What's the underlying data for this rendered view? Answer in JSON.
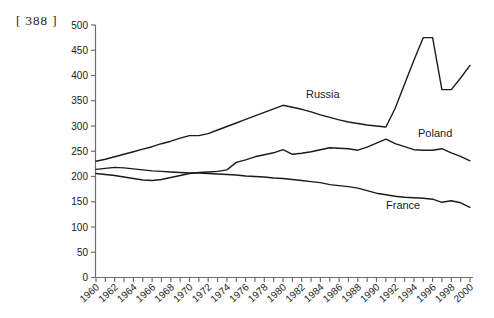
{
  "page_marker": "[ 388 ]",
  "colors": {
    "background": "#ffffff",
    "line": "#1b1b1b",
    "axis": "#6e6e6e",
    "tick_text": "#1a1a1a",
    "series_label_text": "#1b1b1b"
  },
  "chart_data": {
    "type": "line",
    "title": "",
    "subtitle": "",
    "xlabel": "",
    "ylabel": "",
    "grid": false,
    "legend_position": "inline-labels",
    "ylim": [
      0,
      500
    ],
    "y_tick_step": 50,
    "x_start": 1960,
    "x_end": 2000,
    "x_tick_step": 1,
    "x_label_step": 2,
    "x": [
      1960,
      1961,
      1962,
      1963,
      1964,
      1965,
      1966,
      1967,
      1968,
      1969,
      1970,
      1971,
      1972,
      1973,
      1974,
      1975,
      1976,
      1977,
      1978,
      1979,
      1980,
      1981,
      1982,
      1983,
      1984,
      1985,
      1986,
      1987,
      1988,
      1989,
      1990,
      1991,
      1992,
      1993,
      1994,
      1995,
      1996,
      1997,
      1998,
      1999,
      2000
    ],
    "series": [
      {
        "name": "Russia",
        "values": [
          230,
          234,
          239,
          244,
          249,
          254,
          259,
          265,
          270,
          276,
          281,
          281,
          285,
          292,
          299,
          306,
          313,
          320,
          327,
          334,
          341,
          337,
          333,
          328,
          322,
          317,
          312,
          308,
          305,
          302,
          300,
          298,
          335,
          383,
          430,
          475,
          475,
          372,
          372,
          395,
          420
        ],
        "label_pos": {
          "x": 306,
          "y": 98
        }
      },
      {
        "name": "Poland",
        "values": [
          206,
          204,
          202,
          199,
          196,
          193,
          192,
          194,
          198,
          202,
          206,
          208,
          209,
          210,
          213,
          228,
          233,
          239,
          243,
          247,
          253,
          244,
          246,
          249,
          253,
          257,
          256,
          255,
          252,
          258,
          266,
          274,
          265,
          259,
          253,
          252,
          252,
          255,
          247,
          240,
          231
        ],
        "label_pos": {
          "x": 418,
          "y": 137
        }
      },
      {
        "name": "France",
        "values": [
          214,
          216,
          218,
          217,
          215,
          213,
          211,
          210,
          209,
          208,
          207,
          207,
          206,
          205,
          204,
          203,
          201,
          200,
          199,
          197,
          196,
          194,
          192,
          190,
          188,
          184,
          182,
          180,
          177,
          172,
          167,
          164,
          161,
          159,
          158,
          157,
          155,
          149,
          152,
          148,
          139
        ],
        "label_pos": {
          "x": 386,
          "y": 209
        }
      }
    ]
  }
}
